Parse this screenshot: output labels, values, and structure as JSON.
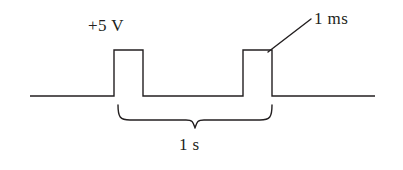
{
  "figure": {
    "background_color": "#ffffff",
    "stroke_color": "#231f20",
    "stroke_width": 1.4,
    "labels": {
      "amplitude": "+5 V",
      "pulse_width": "1 ms",
      "period": "1 s"
    }
  },
  "chart_data": {
    "type": "line",
    "title": "",
    "xlabel": "",
    "ylabel": "",
    "signal": {
      "name": "Voltage waveform",
      "high_level": "+5 V",
      "low_level": "0 V",
      "pulse_width": "1 ms",
      "period": "1 s",
      "pulse_count": 2
    },
    "waveform_points_px": [
      [
        30,
        96
      ],
      [
        114,
        96
      ],
      [
        114,
        50
      ],
      [
        143,
        50
      ],
      [
        143,
        96
      ],
      [
        243,
        96
      ],
      [
        243,
        50
      ],
      [
        272,
        50
      ],
      [
        272,
        96
      ],
      [
        375,
        96
      ]
    ],
    "annotations": [
      {
        "name": "amplitude",
        "text": "+5 V",
        "kind": "text",
        "x": 88,
        "y": 17
      },
      {
        "name": "pulse-width",
        "text": "1 ms",
        "kind": "leader-line",
        "leader_from": [
          268,
          52
        ],
        "leader_to": [
          311,
          19
        ],
        "x": 314,
        "y": 10
      },
      {
        "name": "period",
        "text": "1 s",
        "kind": "brace",
        "brace_left_x": 118,
        "brace_right_x": 272,
        "brace_top_y": 105,
        "brace_bottom_y": 128,
        "x": 179,
        "y": 136
      }
    ]
  }
}
